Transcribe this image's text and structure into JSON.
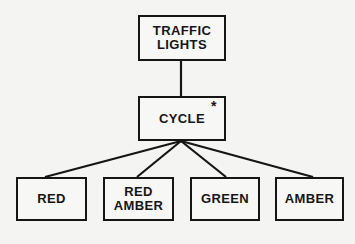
{
  "diagram": {
    "type": "jackson-structure-diagram",
    "root": {
      "id": "traffic-lights",
      "lines": [
        "TRAFFIC",
        "LIGHTS"
      ],
      "box": {
        "x": 138,
        "y": 15,
        "w": 88,
        "h": 46
      }
    },
    "iteration": {
      "id": "cycle",
      "lines": [
        "CYCLE"
      ],
      "marker": "*",
      "box": {
        "x": 138,
        "y": 96,
        "w": 88,
        "h": 45
      }
    },
    "children": [
      {
        "id": "red",
        "lines": [
          "RED"
        ],
        "box": {
          "x": 16,
          "y": 177,
          "w": 71,
          "h": 44
        },
        "anchor": [
          45,
          177
        ]
      },
      {
        "id": "red-amber",
        "lines": [
          "RED",
          "AMBER"
        ],
        "box": {
          "x": 103,
          "y": 177,
          "w": 71,
          "h": 44
        },
        "anchor": [
          137,
          177
        ]
      },
      {
        "id": "green",
        "lines": [
          "GREEN"
        ],
        "box": {
          "x": 190,
          "y": 177,
          "w": 70,
          "h": 44
        },
        "anchor": [
          226,
          177
        ]
      },
      {
        "id": "amber",
        "lines": [
          "AMBER"
        ],
        "box": {
          "x": 275,
          "y": 177,
          "w": 69,
          "h": 44
        },
        "anchor": [
          313,
          177
        ]
      }
    ],
    "edges": [
      {
        "from": "traffic-lights",
        "to": "cycle",
        "x1": 181,
        "y1": 61,
        "x2": 181,
        "y2": 96
      },
      {
        "from": "cycle",
        "to": "red",
        "x1": 181,
        "y1": 141,
        "x2": 45,
        "y2": 177
      },
      {
        "from": "cycle",
        "to": "red-amber",
        "x1": 181,
        "y1": 141,
        "x2": 137,
        "y2": 177
      },
      {
        "from": "cycle",
        "to": "green",
        "x1": 181,
        "y1": 141,
        "x2": 226,
        "y2": 177
      },
      {
        "from": "cycle",
        "to": "amber",
        "x1": 181,
        "y1": 141,
        "x2": 313,
        "y2": 177
      }
    ],
    "colors": {
      "ink": "#151515",
      "paper": "#f4f4f2"
    }
  }
}
